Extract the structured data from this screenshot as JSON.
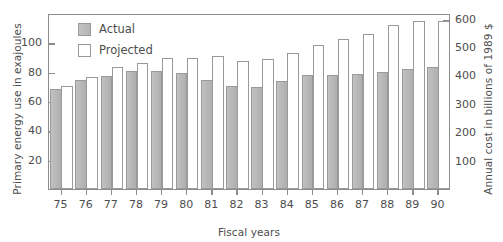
{
  "chart_data": {
    "type": "bar",
    "title": "",
    "xlabel": "Fiscal years",
    "ylabel": "Primary energy use in exajoules",
    "ylabel_right": "Annual cost in billions of 1989 $",
    "categories": [
      "75",
      "76",
      "77",
      "78",
      "79",
      "80",
      "81",
      "82",
      "83",
      "84",
      "85",
      "86",
      "87",
      "88",
      "89",
      "90"
    ],
    "series": [
      {
        "name": "Actual",
        "color": "#b8b8b8",
        "values": [
          68.5,
          74.5,
          77.0,
          80.5,
          80.5,
          79.0,
          74.5,
          70.5,
          69.5,
          73.5,
          77.5,
          77.5,
          78.5,
          80.0,
          82.0,
          83.5
        ]
      },
      {
        "name": "Projected",
        "color": "#ffffff",
        "values": [
          70.0,
          76.5,
          83.0,
          86.0,
          89.0,
          89.0,
          90.5,
          87.0,
          88.5,
          92.5,
          98.5,
          102.5,
          105.5,
          111.5,
          114.5,
          114.5
        ]
      }
    ],
    "ylim": [
      0,
      120
    ],
    "yticks": [
      20,
      40,
      60,
      80,
      100
    ],
    "ylim_right": [
      0,
      620
    ],
    "yticks_right": [
      100,
      200,
      300,
      400,
      500,
      600
    ],
    "grid": false,
    "legend_position": "top-left",
    "legend_entries": [
      "Actual",
      "Projected"
    ]
  },
  "legend": {
    "actual_label": "Actual",
    "projected_label": "Projected"
  },
  "axes": {
    "left_title": "Primary energy use in exajoules",
    "right_title": "Annual cost in billions of 1989 $",
    "bottom_title": "Fiscal years"
  }
}
